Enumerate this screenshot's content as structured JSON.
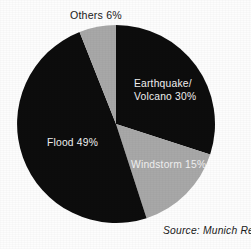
{
  "chart_data": {
    "type": "pie",
    "title": "",
    "subtitle": "",
    "xlabel": "",
    "ylabel": "",
    "legend_position": "none",
    "labels_on_slices": true,
    "categories": [
      "Earthquake/Volcano",
      "Windstorm",
      "Flood",
      "Others"
    ],
    "values": [
      30,
      15,
      49,
      6
    ],
    "unit": "%",
    "total": 100,
    "slices": [
      {
        "name": "Earthquake/Volcano",
        "value": 30,
        "label_line1": "Earthquake/",
        "label_line2": "Volcano 30%",
        "value_label": "30%",
        "color": "#0d0d0d",
        "text_color": "#f2f2f2",
        "label_placement": "inside",
        "start_angle_deg": 0,
        "end_angle_deg": 108
      },
      {
        "name": "Windstorm",
        "value": 15,
        "label_line1": "Windstorm 15%",
        "value_label": "15%",
        "color": "#a8a8a8",
        "text_color": "#f6f6f6",
        "label_placement": "inside",
        "start_angle_deg": 108,
        "end_angle_deg": 162
      },
      {
        "name": "Flood",
        "value": 49,
        "label_line1": "Flood 49%",
        "value_label": "49%",
        "color": "#0d0d0d",
        "text_color": "#f2f2f2",
        "label_placement": "inside",
        "start_angle_deg": 162,
        "end_angle_deg": 338.4
      },
      {
        "name": "Others",
        "value": 6,
        "label_line1": "Others 6%",
        "value_label": "6%",
        "color": "#a8a8a8",
        "text_color": "#1a1a1a",
        "label_placement": "outside-top",
        "start_angle_deg": 338.4,
        "end_angle_deg": 360
      }
    ],
    "annotations": [
      {
        "name": "source",
        "text": "Source: Munich Re",
        "position": "bottom-right",
        "style": "italic"
      }
    ],
    "colors": {
      "background": "#fdfdfd",
      "dark_slice": "#0d0d0d",
      "gray_slice": "#a8a8a8",
      "label_light": "#f2f2f2",
      "label_dark": "#1a1a1a"
    },
    "geometry": {
      "center_x": 116,
      "center_y": 124,
      "radius": 99
    }
  },
  "labels": {
    "others": "Others 6%",
    "earthquake_line1": "Earthquake/",
    "earthquake_line2": "Volcano 30%",
    "flood": "Flood 49%",
    "windstorm": "Windstorm 15%",
    "source": "Source: Munich Re"
  }
}
